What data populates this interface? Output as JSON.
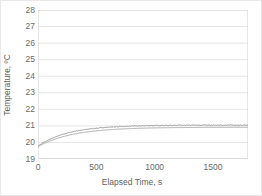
{
  "chart_data": {
    "type": "line",
    "title": "",
    "xlabel": "Elapsed Time, s",
    "ylabel": "Temperature, ºC",
    "xlim": [
      0,
      1800
    ],
    "ylim": [
      19,
      28
    ],
    "xticks": [
      0,
      500,
      1000,
      1500
    ],
    "xticklabels": [
      "0",
      "500",
      "1000",
      "1500"
    ],
    "yticks": [
      19,
      20,
      21,
      22,
      23,
      24,
      25,
      26,
      27,
      28
    ],
    "yticklabels": [
      "19",
      "20",
      "21",
      "22",
      "23",
      "24",
      "25",
      "26",
      "27",
      "28"
    ],
    "grid": "horizontal",
    "grid_color": "#e0e0e0",
    "legend": "none",
    "plot_background": "#ffffff",
    "border_color": "#d9d9d9",
    "series": [
      {
        "name": "sensor-upper",
        "color": "#8c8c8c",
        "noisy": true,
        "plateau": 21.05,
        "start": 19.78,
        "tau": 260,
        "x": [
          0,
          20,
          40,
          60,
          80,
          100,
          120,
          150,
          180,
          210,
          250,
          300,
          350,
          400,
          450,
          500,
          560,
          620,
          700,
          800,
          900,
          1000,
          1100,
          1200,
          1300,
          1400,
          1500,
          1600,
          1700,
          1800
        ],
        "y": [
          19.78,
          19.93,
          20.08,
          20.21,
          20.32,
          20.42,
          20.5,
          20.61,
          20.7,
          20.77,
          20.84,
          20.9,
          20.94,
          20.97,
          20.99,
          21.0,
          21.01,
          21.02,
          21.03,
          21.04,
          21.04,
          21.05,
          21.05,
          21.05,
          21.06,
          21.06,
          21.05,
          21.06,
          21.06,
          21.05
        ]
      },
      {
        "name": "sensor-lower",
        "color": "#9e9e9e",
        "noisy": false,
        "plateau": 20.92,
        "start": 19.75,
        "tau": 300,
        "x": [
          0,
          20,
          40,
          60,
          80,
          100,
          120,
          150,
          180,
          210,
          250,
          300,
          350,
          400,
          450,
          500,
          560,
          620,
          700,
          800,
          900,
          1000,
          1100,
          1200,
          1300,
          1400,
          1500,
          1600,
          1700,
          1800
        ],
        "y": [
          19.75,
          19.89,
          20.02,
          20.14,
          20.25,
          20.34,
          20.42,
          20.52,
          20.6,
          20.66,
          20.72,
          20.78,
          20.82,
          20.85,
          20.87,
          20.88,
          20.89,
          20.9,
          20.9,
          20.91,
          20.91,
          20.91,
          20.92,
          20.92,
          20.92,
          20.92,
          20.92,
          20.92,
          20.92,
          20.92
        ]
      }
    ]
  }
}
